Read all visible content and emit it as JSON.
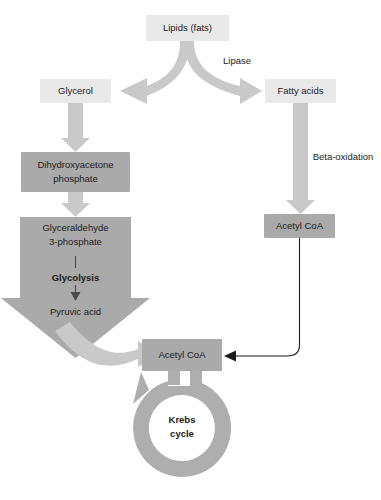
{
  "diagram": {
    "colors": {
      "box_light": "#e9e9e9",
      "box_dark": "#aaaaaa",
      "flow_arrow": "#c9c9c9",
      "flow_arrow_dark": "#aaaaaa",
      "ring": "#aeaeae",
      "thin_line": "#1b1b1b",
      "text": "#1b1b1b",
      "background": "#ffffff"
    },
    "nodes": {
      "lipids": {
        "label": "Lipids (fats)",
        "style": "box-light"
      },
      "glycerol": {
        "label": "Glycerol",
        "style": "box-light"
      },
      "fatty_acids": {
        "label": "Fatty acids",
        "style": "box-light"
      },
      "dhap_line1": {
        "label": "Dihydroxyacetone",
        "style": "box-dark"
      },
      "dhap_line2": {
        "label": "phosphate",
        "style": "box-dark"
      },
      "g3p_line1": {
        "label": "Glyceraldehyde",
        "style": "box-dark"
      },
      "g3p_line2": {
        "label": "3-phosphate",
        "style": "box-dark"
      },
      "glycolysis": {
        "label": "Glycolysis",
        "style": "arrow-text-bold"
      },
      "pyruvic_acid": {
        "label": "Pyruvic acid",
        "style": "arrow-text"
      },
      "acetyl_coa_right": {
        "label": "Acetyl CoA",
        "style": "box-dark"
      },
      "acetyl_coa_center": {
        "label": "Acetyl CoA",
        "style": "box-dark"
      },
      "krebs_line1": {
        "label": "Krebs",
        "style": "ring-text-bold"
      },
      "krebs_line2": {
        "label": "cycle",
        "style": "ring-text-bold"
      }
    },
    "edge_labels": {
      "lipase": "Lipase",
      "beta_oxidation": "Beta-oxidation"
    }
  }
}
